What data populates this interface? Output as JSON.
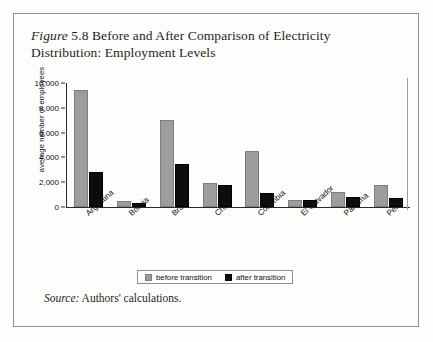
{
  "figure": {
    "label": "Figure",
    "number": "5.8",
    "title": "Before and After Comparison of Electricity Distribution: Employment Levels",
    "title_line1": "Figure 5.8 Before and After Comparison of Electricity",
    "title_line2": "Distribution: Employment Levels"
  },
  "source": {
    "prefix": "Source:",
    "text": "Authors' calculations.",
    "full": "Source: Authors' calculations."
  },
  "legend": {
    "before_label": "before transition",
    "after_label": "after transition"
  },
  "colors": {
    "before": "#9d9d9d",
    "after": "#0d0d0d",
    "axis": "#2b2b2b",
    "page_background": "#fdfdfc",
    "border": "#8d8d8d"
  },
  "chart_data": {
    "type": "bar",
    "title": "Figure 5.8 Before and After Comparison of Electricity Distribution: Employment Levels",
    "xlabel": "",
    "ylabel": "average number of employees",
    "ylim": [
      0,
      10000
    ],
    "ytick_labels": [
      "0",
      "2,000",
      "4,000",
      "6,000",
      "8,000",
      "10,000"
    ],
    "ytick_values": [
      0,
      2000,
      4000,
      6000,
      8000,
      10000
    ],
    "grid": false,
    "legend_position": "bottom",
    "categories": [
      "Argentina",
      "Bolivia",
      "Brazil",
      "Chile",
      "Colombia",
      "El Salvador",
      "Panama",
      "Peru"
    ],
    "series": [
      {
        "name": "before transition",
        "color": "#9d9d9d",
        "values": [
          9400,
          500,
          7000,
          1900,
          4500,
          600,
          1200,
          1800
        ]
      },
      {
        "name": "after transition",
        "color": "#0d0d0d",
        "values": [
          2800,
          350,
          3500,
          1750,
          1100,
          550,
          800,
          700
        ]
      }
    ]
  }
}
